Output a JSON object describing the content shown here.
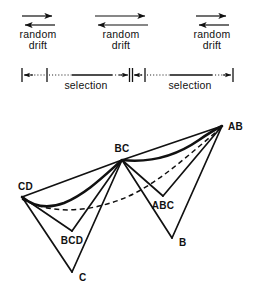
{
  "figure": {
    "background_color": "#ffffff",
    "ink_color": "#111111"
  },
  "drift_panels": [
    {
      "id": "drift-left",
      "line1": "random",
      "line2": "drift",
      "arrow_right": {
        "x1": 22,
        "x2": 55,
        "y": 16
      },
      "arrow_left": {
        "x1": 55,
        "x2": 22,
        "y": 25
      },
      "text_x": 38,
      "text_y1": 38,
      "text_y2": 49
    },
    {
      "id": "drift-center",
      "line1": "random",
      "line2": "drift",
      "arrow_right": {
        "x1": 95,
        "x2": 148,
        "y": 16
      },
      "arrow_left": {
        "x1": 148,
        "x2": 95,
        "y": 25
      },
      "text_x": 121,
      "text_y1": 38,
      "text_y2": 49
    },
    {
      "id": "drift-right",
      "line1": "random",
      "line2": "drift",
      "arrow_right": {
        "x1": 196,
        "x2": 229,
        "y": 16
      },
      "arrow_left": {
        "x1": 229,
        "x2": 196,
        "y": 25
      },
      "text_x": 212,
      "text_y1": 38,
      "text_y2": 49
    }
  ],
  "selection_axis": {
    "y": 75,
    "label_y": 89,
    "caps": [
      {
        "name": "cap-left",
        "x": 22
      },
      {
        "name": "cap-mid-left",
        "x": 47
      },
      {
        "name": "cap-mid-right",
        "x": 145
      },
      {
        "name": "cap-right",
        "x": 233
      }
    ],
    "arrow_pair_center_x": 130,
    "segments": [
      {
        "name": "dotted-1",
        "style": "dotted",
        "x1": 24,
        "x2": 45
      },
      {
        "name": "dotted-2",
        "style": "dotted",
        "x1": 49,
        "x2": 72
      },
      {
        "name": "solid-1",
        "style": "solid",
        "x1": 72,
        "x2": 112
      },
      {
        "name": "dotted-3",
        "style": "dotted",
        "x1": 112,
        "x2": 127
      },
      {
        "name": "dotted-4",
        "style": "dotted",
        "x1": 133,
        "x2": 143
      },
      {
        "name": "dotted-5",
        "style": "dotted",
        "x1": 147,
        "x2": 170
      },
      {
        "name": "solid-2",
        "style": "solid",
        "x1": 170,
        "x2": 212
      },
      {
        "name": "dotted-6",
        "style": "dotted",
        "x1": 212,
        "x2": 230
      }
    ],
    "labels": [
      {
        "name": "selection-label-left",
        "text": "selection",
        "x": 86
      },
      {
        "name": "selection-label-right",
        "text": "selection",
        "x": 190
      }
    ]
  },
  "tree": {
    "nodes": [
      {
        "id": "CD",
        "label": "CD",
        "x": 22,
        "y": 197,
        "label_x": 18,
        "label_y": 190,
        "anchor": "start"
      },
      {
        "id": "BC",
        "label": "BC",
        "x": 122,
        "y": 160,
        "label_x": 122,
        "label_y": 152,
        "anchor": "middle"
      },
      {
        "id": "AB",
        "label": "AB",
        "x": 222,
        "y": 126,
        "label_x": 229,
        "label_y": 129,
        "anchor": "start"
      },
      {
        "id": "BCD",
        "label": "BCD",
        "x": 72,
        "y": 231,
        "label_x": 72,
        "label_y": 244,
        "anchor": "middle"
      },
      {
        "id": "C",
        "label": "C",
        "x": 72,
        "y": 272,
        "label_x": 79,
        "label_y": 280,
        "anchor": "start"
      },
      {
        "id": "ABC",
        "label": "ABC",
        "x": 163,
        "y": 196,
        "label_x": 163,
        "label_y": 209,
        "anchor": "middle"
      },
      {
        "id": "B",
        "label": "B",
        "x": 172,
        "y": 238,
        "label_x": 179,
        "label_y": 245,
        "anchor": "start"
      }
    ],
    "edges": [
      {
        "name": "edge-cd-bcd",
        "from": "CD",
        "to": "BCD"
      },
      {
        "name": "edge-cd-c",
        "from": "CD",
        "to": "C"
      },
      {
        "name": "edge-cd-bc",
        "from": "CD",
        "to": "BC"
      },
      {
        "name": "edge-bcd-bc",
        "from": "BCD",
        "to": "BC"
      },
      {
        "name": "edge-c-bc",
        "from": "C",
        "to": "BC"
      },
      {
        "name": "edge-bc-abc",
        "from": "BC",
        "to": "ABC"
      },
      {
        "name": "edge-bc-b",
        "from": "BC",
        "to": "B"
      },
      {
        "name": "edge-bc-ab",
        "from": "BC",
        "to": "AB"
      },
      {
        "name": "edge-abc-ab",
        "from": "ABC",
        "to": "AB"
      },
      {
        "name": "edge-b-ab",
        "from": "B",
        "to": "AB"
      }
    ],
    "envelope_path": "M 22 197 C 34 207 48 209 64 203 C 86 194 104 176 122 160 C 150 163 176 156 199 140 C 209 133 216 129 222 126",
    "dashed_path": "M 22 199 C 52 215 88 212 122 199 C 156 186 192 152 222 127"
  }
}
